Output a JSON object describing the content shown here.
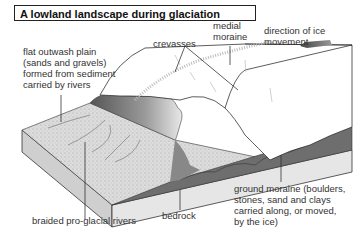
{
  "title": "A lowland landscape during glaciation",
  "labels": {
    "outwash_plain": "flat outwash plain\n(sands and gravels)\nformed from sediment\ncarried by rivers",
    "crevasses": "crevasses",
    "medial_moraine": "medial\nmoraine",
    "ice_direction": "direction of ice\nmovement",
    "bedrock": "bedrock",
    "braided_rivers": "braided pro-glacial rivers",
    "ground_moraine": "ground moraine (boulders,\nstones, sand and clays\ncarried along, or moved,\nby the ice)"
  },
  "colors": {
    "ice": "#ffffff",
    "outwash": "#d9d9d9",
    "moraine": "#6e6e6e",
    "bedrock_side": "#e2e2e2",
    "arrow": "#555555",
    "line": "#333333"
  }
}
